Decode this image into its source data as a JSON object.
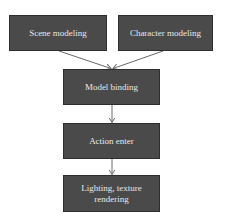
{
  "diagram": {
    "type": "flowchart",
    "colors": {
      "node_fill": "#4a4a4a",
      "node_border": "#2e2e2e",
      "node_text": "#e8e8e8",
      "edge": "#6a6a6a",
      "background": "#ffffff"
    },
    "nodes": [
      {
        "id": "scene",
        "label": "Scene modeling"
      },
      {
        "id": "character",
        "label": "Character modeling"
      },
      {
        "id": "binding",
        "label": "Model binding"
      },
      {
        "id": "action",
        "label": "Action enter"
      },
      {
        "id": "lighting",
        "label": "Lighting, texture rendering"
      }
    ],
    "edges": [
      {
        "from": "scene",
        "to": "binding"
      },
      {
        "from": "character",
        "to": "binding"
      },
      {
        "from": "binding",
        "to": "action"
      },
      {
        "from": "action",
        "to": "lighting"
      }
    ]
  }
}
